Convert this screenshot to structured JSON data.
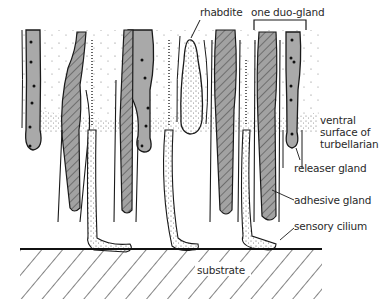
{
  "figure": {
    "colors": {
      "outline": "#1a1a1a",
      "releaser_fill": "#a9a9a9",
      "adhesive_fill": "#9b9b9b",
      "hatch": "#4a4a4a",
      "stipple": "#6a6a6a",
      "background": "#ffffff"
    }
  },
  "labels": {
    "rhabdite": "rhabdite",
    "one_duo_gland": "one duo-gland",
    "ventral_line1": "ventral",
    "ventral_line2": "surface of",
    "ventral_line3": "turbellarian",
    "releaser_gland": "releaser gland",
    "adhesive_gland": "adhesive gland",
    "sensory_cilium": "sensory cilium",
    "substrate": "substrate"
  }
}
